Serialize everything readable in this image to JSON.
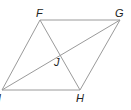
{
  "diagram": {
    "type": "parallelogram-with-diagonals",
    "vertices": {
      "F": {
        "label": "F",
        "x": 40,
        "y": 20,
        "label_x": 36,
        "label_y": 17
      },
      "G": {
        "label": "G",
        "x": 120,
        "y": 20,
        "label_x": 115,
        "label_y": 17
      },
      "H": {
        "label": "H",
        "x": 80,
        "y": 90,
        "label_x": 76,
        "label_y": 102
      },
      "I": {
        "label": "I",
        "x": 2,
        "y": 90,
        "label_x": -2,
        "label_y": 102
      }
    },
    "intersection": {
      "label": "J",
      "x": 60,
      "y": 55,
      "label_x": 54,
      "label_y": 66
    },
    "sides": [
      [
        "F",
        "G"
      ],
      [
        "G",
        "H"
      ],
      [
        "H",
        "I"
      ],
      [
        "I",
        "F"
      ]
    ],
    "diagonals": [
      [
        "F",
        "H"
      ],
      [
        "I",
        "G"
      ]
    ],
    "line_color": "#9a9a9a",
    "label_color": "#222222"
  }
}
